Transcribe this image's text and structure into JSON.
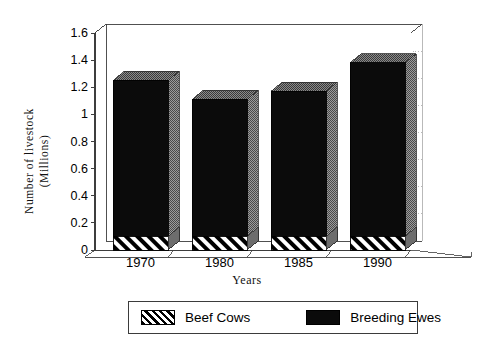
{
  "chart_data": {
    "type": "bar",
    "subtype": "stacked-column-3d",
    "title": "",
    "xlabel": "Years",
    "ylabel": "Number of livestock\n(Millions)",
    "categories": [
      "1970",
      "1980",
      "1985",
      "1990"
    ],
    "series": [
      {
        "name": "Beef Cows",
        "values": [
          0.1,
          0.1,
          0.1,
          0.1
        ],
        "fill": "diagonal-hatch",
        "color": "#000000"
      },
      {
        "name": "Breeding Ewes",
        "values": [
          1.15,
          1.01,
          1.07,
          1.28
        ],
        "fill": "solid",
        "color": "#0b0b0b"
      }
    ],
    "totals": [
      1.25,
      1.11,
      1.17,
      1.38
    ],
    "ylim": [
      0,
      1.6
    ],
    "yticks": [
      "0",
      "0.2",
      "0.4",
      "0.6",
      "0.8",
      "1",
      "1.2",
      "1.4",
      "1.6"
    ],
    "ytick_values": [
      0,
      0.2,
      0.4,
      0.6,
      0.8,
      1.0,
      1.2,
      1.4,
      1.6
    ],
    "grid": "horizontal-dotted",
    "legend_position": "bottom-outside",
    "legend_entries": [
      "Beef Cows",
      "Breeding Ewes"
    ]
  },
  "axis": {
    "y_title_line1": "Number of livestock",
    "y_title_line2": "(Millions)",
    "x_title": "Years"
  },
  "legend": {
    "items": [
      {
        "label": "Beef Cows",
        "swatch": "hatch-swatch"
      },
      {
        "label": "Breeding Ewes",
        "swatch": "solid-swatch"
      }
    ]
  },
  "colors": {
    "bar_front": "#0b0b0b",
    "bar_side": "#8d8d8d",
    "bar_top": "#6f6f6f",
    "axis_line": "#3d3d3d",
    "grid_line": "#a8a8a8",
    "floor": "#ffffff",
    "background": "#ffffff"
  }
}
